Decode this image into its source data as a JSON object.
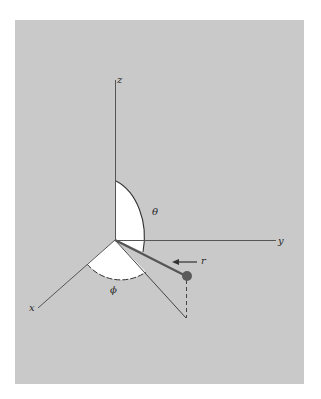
{
  "figure": {
    "type": "spherical-coordinate-system",
    "background_color": "#c9c9c9",
    "sector_color": "#ffffff",
    "line_color": "#555555",
    "point_color": "#5a5a5a",
    "labels": {
      "z_axis": "z",
      "y_axis": "y",
      "x_axis": "x",
      "theta": "θ",
      "phi": "ϕ",
      "r": "r"
    }
  }
}
